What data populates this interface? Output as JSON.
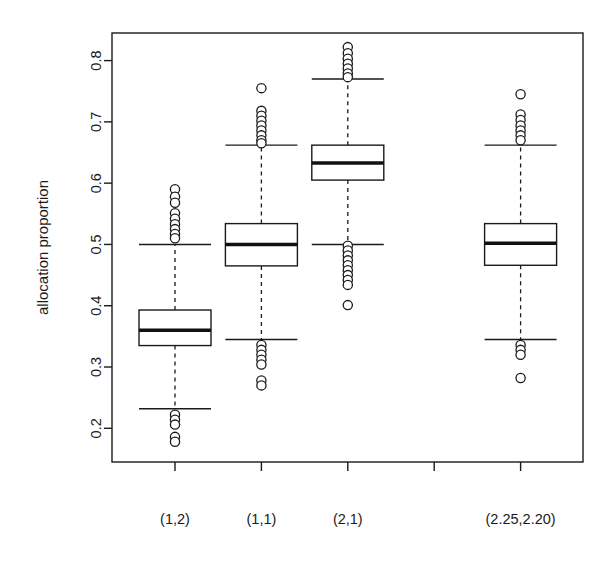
{
  "chart_data": {
    "type": "box",
    "title": "",
    "xlabel": "",
    "ylabel": "allocation proportion",
    "grid": false,
    "legend": "none",
    "ylim": [
      0.145,
      0.845
    ],
    "yticks": [
      "0.2",
      "0.3",
      "0.4",
      "0.5",
      "0.6",
      "0.7",
      "0.8"
    ],
    "ytick_values": [
      0.2,
      0.3,
      0.4,
      0.5,
      0.6,
      0.7,
      0.8
    ],
    "categories": [
      "(1,2)",
      "(1,1)",
      "(2,1)",
      "(2.25,2.20)"
    ],
    "x_positions": [
      1,
      2,
      3,
      5
    ],
    "x_tick_count": 5,
    "boxes": [
      {
        "label": "(1,2)",
        "x": 1,
        "whisker_low": 0.232,
        "q1": 0.335,
        "median": 0.36,
        "q3": 0.393,
        "whisker_high": 0.5,
        "outliers": [
          0.59,
          0.578,
          0.568,
          0.551,
          0.542,
          0.533,
          0.525,
          0.517,
          0.51,
          0.222,
          0.214,
          0.206,
          0.186,
          0.178
        ]
      },
      {
        "label": "(1,1)",
        "x": 2,
        "whisker_low": 0.345,
        "q1": 0.465,
        "median": 0.5,
        "q3": 0.534,
        "whisker_high": 0.662,
        "outliers": [
          0.755,
          0.718,
          0.71,
          0.702,
          0.694,
          0.686,
          0.678,
          0.67,
          0.665,
          0.336,
          0.328,
          0.32,
          0.312,
          0.304,
          0.278,
          0.27
        ]
      },
      {
        "label": "(2,1)",
        "x": 3,
        "whisker_low": 0.5,
        "q1": 0.605,
        "median": 0.633,
        "q3": 0.662,
        "whisker_high": 0.77,
        "outliers": [
          0.822,
          0.812,
          0.803,
          0.795,
          0.787,
          0.779,
          0.773,
          0.498,
          0.49,
          0.482,
          0.474,
          0.466,
          0.458,
          0.45,
          0.442,
          0.434,
          0.401
        ]
      },
      {
        "label": "(2.25,2.20)",
        "x": 5,
        "whisker_low": 0.345,
        "q1": 0.466,
        "median": 0.502,
        "q3": 0.534,
        "whisker_high": 0.662,
        "outliers": [
          0.745,
          0.712,
          0.703,
          0.694,
          0.686,
          0.678,
          0.67,
          0.336,
          0.328,
          0.32,
          0.282
        ]
      }
    ]
  },
  "colors": {
    "ink": "#1a1a1a",
    "background": "#ffffff"
  }
}
